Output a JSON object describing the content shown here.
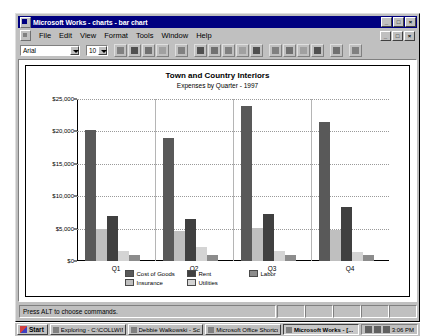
{
  "window": {
    "title": "Microsoft Works - charts - bar chart",
    "app_icon": "works-icon",
    "minimize_label": "_",
    "maximize_label": "□",
    "close_label": "×"
  },
  "menubar": {
    "items": [
      {
        "label": "File"
      },
      {
        "label": "Edit"
      },
      {
        "label": "View"
      },
      {
        "label": "Format"
      },
      {
        "label": "Tools"
      },
      {
        "label": "Window"
      },
      {
        "label": "Help"
      }
    ],
    "doc_minimize_label": "_",
    "doc_restore_label": "□",
    "doc_close_label": "×"
  },
  "toolbar": {
    "font_name": "Arial",
    "font_size": "10",
    "buttons": [
      {
        "name": "new-button"
      },
      {
        "name": "save-button"
      },
      {
        "name": "print-button"
      },
      {
        "name": "print-preview-button"
      },
      {
        "name": "cut-button"
      },
      {
        "name": "bar-chart-button"
      },
      {
        "name": "line-chart-button"
      },
      {
        "name": "pie-chart-button"
      },
      {
        "name": "stacked-chart-button"
      },
      {
        "name": "area-chart-button"
      },
      {
        "name": "combo-chart-button"
      },
      {
        "name": "3d-chart-button"
      },
      {
        "name": "xy-chart-button"
      },
      {
        "name": "radar-chart-button"
      },
      {
        "name": "chart-type-button"
      },
      {
        "name": "help-button"
      }
    ]
  },
  "statusbar": {
    "message": "Press ALT to choose commands."
  },
  "taskbar": {
    "start_label": "Start",
    "tasks": [
      {
        "label": "Exploring - C:\\COLLWIN...",
        "active": false
      },
      {
        "label": "Debbie Walkowski - Sch...",
        "active": false
      },
      {
        "label": "Microsoft Office Shortcut",
        "active": false
      },
      {
        "label": "Microsoft Works - [...",
        "active": true
      }
    ],
    "clock": "3:06 PM"
  },
  "chart_data": {
    "type": "bar",
    "title": "Town and Country Interiors",
    "subtitle": "Expenses by Quarter - 1997",
    "xlabel": "",
    "ylabel": "",
    "ylim": [
      0,
      25000
    ],
    "yticks": [
      0,
      5000,
      10000,
      15000,
      20000,
      25000
    ],
    "ytick_labels": [
      "$0",
      "$5,000",
      "$10,000",
      "$15,000",
      "$20,000",
      "$25,000"
    ],
    "grid": true,
    "legend_position": "bottom",
    "categories": [
      "Q1",
      "Q2",
      "Q3",
      "Q4"
    ],
    "series": [
      {
        "name": "Cost of Goods",
        "color": "#595959",
        "values": [
          20200,
          19000,
          23900,
          21400
        ]
      },
      {
        "name": "Insurance",
        "color": "#bfbfbf",
        "values": [
          4900,
          4700,
          5100,
          4800
        ]
      },
      {
        "name": "Rent",
        "color": "#404040",
        "values": [
          7000,
          6500,
          7200,
          8400
        ]
      },
      {
        "name": "Utilities",
        "color": "#d4d4d4",
        "values": [
          1500,
          2100,
          1500,
          1400
        ]
      },
      {
        "name": "Labor",
        "color": "#8c8c8c",
        "values": [
          900,
          900,
          1000,
          900
        ]
      }
    ]
  }
}
